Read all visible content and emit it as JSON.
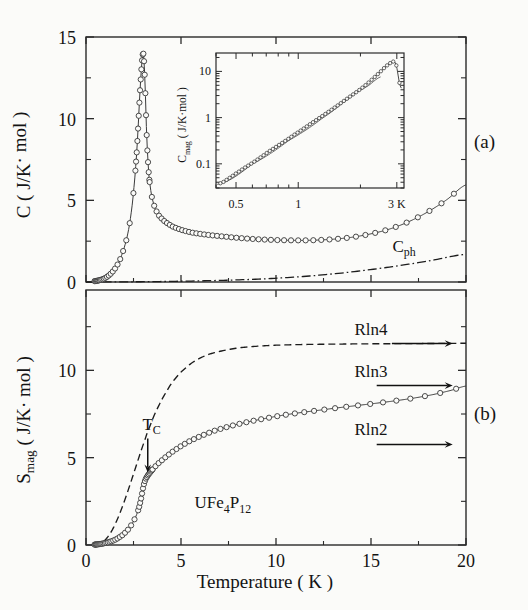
{
  "figure": {
    "sample_label": "UFe",
    "sample_label_sub1": "4",
    "sample_label_mid": "P",
    "sample_label_sub2": "12",
    "panel_a_label": "(a)",
    "panel_b_label": "(b)",
    "xaxis_label": "Temperature  ( K )"
  },
  "chart_data": [
    {
      "type": "line",
      "id": "panel-a",
      "title": "",
      "xlabel": "Temperature ( K )",
      "ylabel": "C  ( J/K·mol )",
      "ylabel_symbol": "C",
      "ylabel_units": "( J/K· mol )",
      "xlim": [
        0,
        20
      ],
      "ylim": [
        0,
        15
      ],
      "xticks": [
        0,
        5,
        10,
        15,
        20
      ],
      "xticklabels": [
        "0",
        "5",
        "10",
        "15",
        "20"
      ],
      "yticks": [
        0,
        5,
        10,
        15
      ],
      "yticklabels": [
        "0",
        "5",
        "10",
        "15"
      ],
      "minor_yticks": [
        2.5,
        7.5,
        12.5
      ],
      "grid": false,
      "legend": false,
      "annotations": [
        {
          "text": "C",
          "sub": "ph",
          "x": 16.2,
          "y": 2.35,
          "name": "cph-label"
        },
        {
          "text": "(a)",
          "x": 21.6,
          "y": 9.2,
          "name": "panel-a-label"
        }
      ],
      "series": [
        {
          "name": "C",
          "marker": "open-circle",
          "linestyle": "solid",
          "x": [
            0.42,
            0.6,
            0.8,
            1.0,
            1.2,
            1.4,
            1.6,
            1.8,
            2.0,
            2.15,
            2.3,
            2.45,
            2.58,
            2.68,
            2.76,
            2.82,
            2.88,
            2.92,
            2.96,
            3.0,
            3.03,
            3.06,
            3.1,
            3.14,
            3.18,
            3.24,
            3.32,
            3.45,
            3.62,
            3.85,
            4.15,
            4.55,
            5.05,
            5.6,
            6.3,
            7.1,
            8.0,
            9.0,
            10.0,
            11.0,
            12.0,
            13.0,
            14.0,
            15.0,
            16.0,
            17.0,
            18.0,
            19.0,
            20.0
          ],
          "y": [
            0.05,
            0.08,
            0.14,
            0.24,
            0.4,
            0.63,
            0.95,
            1.4,
            2.05,
            2.7,
            3.6,
            4.9,
            6.5,
            8.1,
            9.8,
            11.2,
            12.4,
            13.1,
            13.7,
            14.0,
            13.9,
            13.4,
            12.4,
            11.0,
            9.4,
            7.8,
            6.4,
            5.3,
            4.55,
            4.05,
            3.7,
            3.4,
            3.18,
            3.02,
            2.9,
            2.8,
            2.7,
            2.62,
            2.57,
            2.55,
            2.56,
            2.62,
            2.74,
            2.95,
            3.25,
            3.7,
            4.3,
            5.05,
            5.95
          ]
        },
        {
          "name": "C_ph",
          "marker": "none",
          "linestyle": "dash-dot",
          "x": [
            0,
            2,
            4,
            6,
            8,
            10,
            12,
            14,
            16,
            18,
            20
          ],
          "y": [
            0.0,
            0.01,
            0.03,
            0.07,
            0.13,
            0.23,
            0.39,
            0.62,
            0.92,
            1.28,
            1.7
          ]
        }
      ]
    },
    {
      "type": "line",
      "id": "inset",
      "scale": "log-log",
      "xlabel": "",
      "ylabel": "C",
      "ylabel_sub": "mag",
      "ylabel_units": "( J/K·mol )",
      "xlim": [
        0.4,
        3.25
      ],
      "ylim": [
        0.03,
        25
      ],
      "xticks": [
        0.5,
        1,
        3
      ],
      "xticklabels": [
        "0.5",
        "1",
        "3 K"
      ],
      "yticks": [
        0.1,
        1,
        10
      ],
      "yticklabels": [
        "0.1",
        "1",
        "10"
      ],
      "grid": false,
      "series": [
        {
          "name": "C_mag",
          "marker": "open-circle",
          "linestyle": "solid",
          "x": [
            0.42,
            0.46,
            0.5,
            0.55,
            0.6,
            0.66,
            0.72,
            0.8,
            0.88,
            0.96,
            1.05,
            1.15,
            1.25,
            1.37,
            1.5,
            1.64,
            1.8,
            1.95,
            2.1,
            2.25,
            2.4,
            2.52,
            2.64,
            2.74,
            2.82,
            2.88,
            2.93,
            2.97,
            3.0,
            3.04,
            3.08,
            3.12,
            3.16
          ],
          "y": [
            0.038,
            0.048,
            0.062,
            0.082,
            0.105,
            0.14,
            0.185,
            0.25,
            0.33,
            0.43,
            0.56,
            0.74,
            0.95,
            1.25,
            1.65,
            2.2,
            2.95,
            3.8,
            4.9,
            6.4,
            8.3,
            10.2,
            12.5,
            14.3,
            15.6,
            16.3,
            16.0,
            14.5,
            12.0,
            8.5,
            6.0,
            4.8,
            4.3
          ]
        },
        {
          "name": "power-law fit",
          "marker": "none",
          "linestyle": "solid-thin",
          "x": [
            0.41,
            0.6,
            0.9,
            1.3,
            1.8,
            2.2,
            2.5
          ],
          "y": [
            0.036,
            0.1,
            0.32,
            0.95,
            2.8,
            5.0,
            7.6
          ]
        }
      ]
    },
    {
      "type": "line",
      "id": "panel-b",
      "xlabel": "Temperature ( K )",
      "ylabel": "S",
      "ylabel_sub": "mag",
      "ylabel_units": "( J/K· mol )",
      "xlim": [
        0,
        20
      ],
      "ylim": [
        0,
        14.6
      ],
      "xticks": [
        0,
        5,
        10,
        15,
        20
      ],
      "xticklabels": [
        "0",
        "5",
        "10",
        "15",
        "20"
      ],
      "yticks": [
        0,
        5,
        10
      ],
      "yticklabels": [
        "0",
        "5",
        "10"
      ],
      "minor_yticks": [
        2.5,
        7.5,
        12.5
      ],
      "grid": false,
      "annotations": [
        {
          "text": "T",
          "sub": "C",
          "x": 3.1,
          "y": 6.5,
          "name": "tc-label",
          "arrow_to_y": 4.3
        },
        {
          "text": "Rln4",
          "value": 11.53,
          "name": "rln4-label"
        },
        {
          "text": "Rln3",
          "value": 9.13,
          "name": "rln3-label"
        },
        {
          "text": "Rln2",
          "value": 5.76,
          "name": "rln2-label"
        },
        {
          "text": "(b)",
          "x": 21.6,
          "y": 7.1,
          "name": "panel-b-label"
        }
      ],
      "series": [
        {
          "name": "S_mag",
          "marker": "open-circle",
          "linestyle": "solid",
          "x": [
            0.42,
            0.7,
            1.0,
            1.3,
            1.6,
            1.9,
            2.1,
            2.3,
            2.5,
            2.65,
            2.78,
            2.88,
            2.96,
            3.02,
            3.08,
            3.15,
            3.25,
            3.4,
            3.6,
            3.85,
            4.15,
            4.5,
            4.9,
            5.4,
            6.0,
            6.7,
            7.5,
            8.4,
            9.3,
            10.3,
            11.3,
            12.3,
            13.3,
            14.3,
            15.3,
            16.3,
            17.3,
            18.3,
            19.2,
            20.0
          ],
          "y": [
            0.02,
            0.05,
            0.11,
            0.2,
            0.34,
            0.55,
            0.75,
            1.0,
            1.35,
            1.7,
            2.1,
            2.55,
            3.0,
            3.35,
            3.6,
            3.8,
            3.98,
            4.2,
            4.45,
            4.72,
            5.0,
            5.3,
            5.6,
            5.92,
            6.22,
            6.52,
            6.78,
            7.02,
            7.22,
            7.42,
            7.58,
            7.72,
            7.86,
            7.99,
            8.12,
            8.26,
            8.42,
            8.62,
            8.85,
            9.1
          ]
        },
        {
          "name": "mean-field / CEF model",
          "marker": "none",
          "linestyle": "dashed",
          "x": [
            0.4,
            0.8,
            1.1,
            1.4,
            1.7,
            2.0,
            2.3,
            2.6,
            2.9,
            3.2,
            3.6,
            4.0,
            4.5,
            5.0,
            5.6,
            6.3,
            7.0,
            8.0,
            9.0,
            10.0,
            11.5,
            13.0,
            15.0,
            17.0,
            20.0
          ],
          "y": [
            0.02,
            0.12,
            0.4,
            0.9,
            1.6,
            2.45,
            3.4,
            4.4,
            5.4,
            6.35,
            7.45,
            8.35,
            9.25,
            9.9,
            10.45,
            10.85,
            11.08,
            11.28,
            11.38,
            11.44,
            11.48,
            11.5,
            11.52,
            11.53,
            11.55
          ]
        }
      ]
    }
  ]
}
